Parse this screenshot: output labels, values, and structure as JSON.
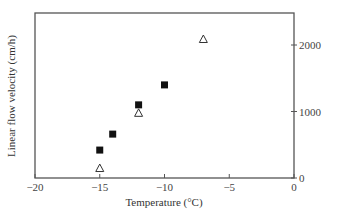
{
  "chart_data": {
    "type": "scatter",
    "title": "",
    "xlabel": "Temperature (°C)",
    "ylabel": "Linear flow velocity (cm/h)",
    "xlim": [
      -20,
      0
    ],
    "ylim": [
      0,
      2500
    ],
    "x_ticks": [
      -20,
      -15,
      -10,
      -5,
      0
    ],
    "x_tick_labels": [
      "−20",
      "−15",
      "−10",
      "−5",
      "0"
    ],
    "y_ticks": [
      0,
      1000,
      2000
    ],
    "y_tick_labels": [
      "0",
      "1000",
      "2000"
    ],
    "y_axis_position": "right",
    "grid": false,
    "legend": null,
    "series": [
      {
        "name": "filled squares",
        "marker": "square-filled",
        "color": "#111111",
        "points": [
          {
            "x": -15,
            "y": 420
          },
          {
            "x": -14,
            "y": 660
          },
          {
            "x": -12,
            "y": 1100
          },
          {
            "x": -10,
            "y": 1400
          }
        ]
      },
      {
        "name": "open triangles",
        "marker": "triangle-open",
        "color": "#333333",
        "points": [
          {
            "x": -15,
            "y": 150
          },
          {
            "x": -12,
            "y": 980
          },
          {
            "x": -7,
            "y": 2090
          }
        ]
      }
    ]
  },
  "colors": {
    "axis": "#555555",
    "background": "#ffffff"
  }
}
